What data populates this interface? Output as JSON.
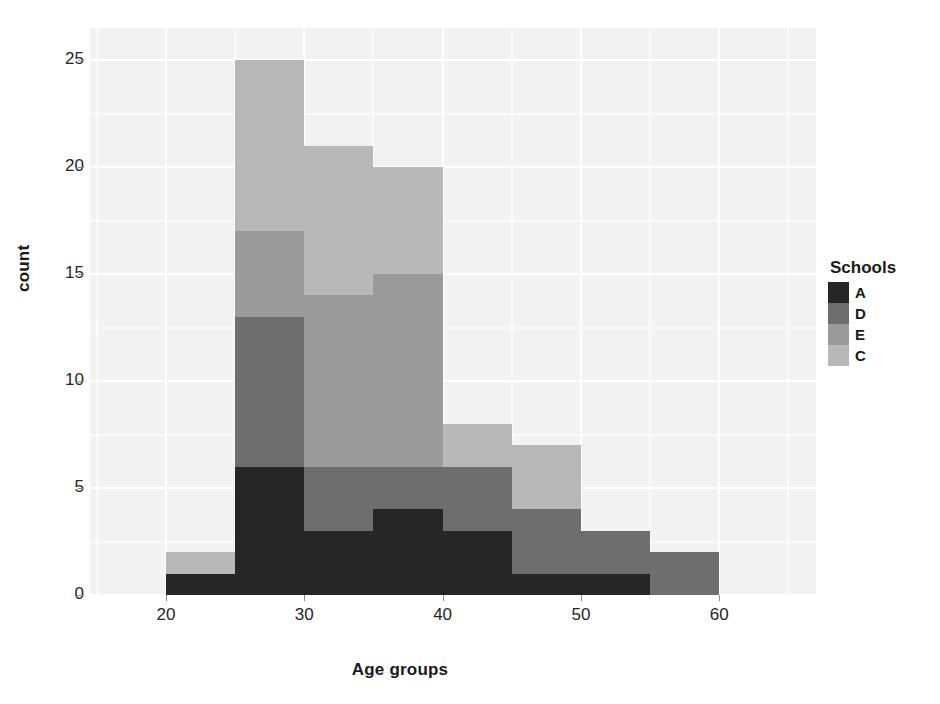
{
  "chart_data": {
    "type": "bar",
    "subtype": "stacked-histogram",
    "title": "",
    "xlabel": "Age groups",
    "ylabel": "count",
    "xlim": [
      14.5,
      67
    ],
    "ylim": [
      0,
      26.5
    ],
    "xticks": [
      20,
      30,
      40,
      50,
      60
    ],
    "yticks": [
      0,
      5,
      10,
      15,
      20,
      25
    ],
    "grid": true,
    "binwidth": 5,
    "bin_starts": [
      20,
      25,
      30,
      35,
      40,
      45,
      50,
      55
    ],
    "bin_labels": [
      "20-25",
      "25-30",
      "30-35",
      "35-40",
      "40-45",
      "45-50",
      "50-55",
      "55-60"
    ],
    "stack_order_bottom_to_top": [
      "A",
      "D",
      "E",
      "C"
    ],
    "legend": {
      "title": "Schools",
      "position": "right",
      "entries": [
        {
          "label": "A",
          "color": "#262626"
        },
        {
          "label": "D",
          "color": "#6e6e6e"
        },
        {
          "label": "E",
          "color": "#9a9a9a"
        },
        {
          "label": "C",
          "color": "#b8b8b8"
        }
      ]
    },
    "series": [
      {
        "name": "A",
        "color": "#262626",
        "values": [
          1,
          6,
          3,
          4,
          3,
          1,
          1,
          0
        ]
      },
      {
        "name": "D",
        "color": "#6e6e6e",
        "values": [
          0,
          7,
          3,
          2,
          3,
          3,
          2,
          2
        ]
      },
      {
        "name": "E",
        "color": "#9a9a9a",
        "values": [
          0,
          4,
          8,
          9,
          0,
          0,
          0,
          0
        ]
      },
      {
        "name": "C",
        "color": "#b8b8b8",
        "values": [
          1,
          8,
          7,
          5,
          2,
          3,
          0,
          0
        ]
      }
    ],
    "totals": [
      2,
      25,
      21,
      20,
      8,
      7,
      3,
      2
    ]
  },
  "panel": {
    "background": "#f2f2f2",
    "gridline_major_color": "#ffffff",
    "gridline_minor_color": "#fafafa"
  }
}
